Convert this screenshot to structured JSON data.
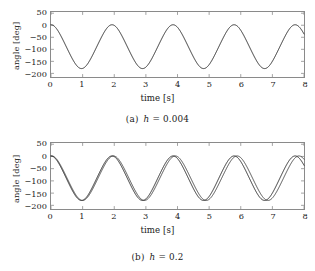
{
  "figure": {
    "background_color": "#ffffff",
    "frame_color": "#8a8a8a",
    "curve_color": "#2b2b2b"
  },
  "subfigures": [
    {
      "tag": "(a)",
      "caption_symbol": "h",
      "caption_equals": "=",
      "caption_value": "0.004",
      "caption_full": "(a)  h = 0.004"
    },
    {
      "tag": "(b)",
      "caption_symbol": "h",
      "caption_equals": "=",
      "caption_value": "0.2",
      "caption_full": "(b)  h = 0.2"
    }
  ],
  "chart_data": [
    {
      "type": "line",
      "title": "",
      "subcaption": "(a)  h = 0.004",
      "xlabel": "time [s]",
      "ylabel": "angle [deg]",
      "xlim": [
        0,
        8
      ],
      "ylim": [
        -215,
        55
      ],
      "xticks": [
        0,
        1,
        2,
        3,
        4,
        5,
        6,
        7,
        8
      ],
      "xticklabels": [
        "0",
        "1",
        "2",
        "3",
        "4",
        "5",
        "6",
        "7",
        "8"
      ],
      "yticks": [
        50,
        0,
        -50,
        -100,
        -150,
        -200
      ],
      "yticklabels": [
        "50",
        "0",
        "−50",
        "−100",
        "−150",
        "−200"
      ],
      "grid": false,
      "legend": false,
      "series": [
        {
          "name": "angle",
          "step_size": 0.004,
          "waveform": "pendulum-like oscillation",
          "offset_deg": -89,
          "amplitude_deg": 91,
          "period_s": 1.93,
          "phase_s": 0.0,
          "start_value_deg": 0,
          "peak_value_deg": 0,
          "trough_value_deg": -180,
          "cycles_visible": 4.15,
          "peaks_t": [
            0.0,
            1.93,
            3.86,
            5.79,
            7.72
          ],
          "troughs_t": [
            0.965,
            2.895,
            4.825,
            6.755
          ]
        }
      ]
    },
    {
      "type": "line",
      "title": "",
      "subcaption": "(b)  h = 0.2",
      "xlabel": "time [s]",
      "ylabel": "angle [deg]",
      "xlim": [
        0,
        8
      ],
      "ylim": [
        -215,
        55
      ],
      "xticks": [
        0,
        1,
        2,
        3,
        4,
        5,
        6,
        7,
        8
      ],
      "xticklabels": [
        "0",
        "1",
        "2",
        "3",
        "4",
        "5",
        "6",
        "7",
        "8"
      ],
      "yticks": [
        50,
        0,
        -50,
        -100,
        -150,
        -200
      ],
      "yticklabels": [
        "50",
        "0",
        "−50",
        "−100",
        "−150",
        "−200"
      ],
      "grid": false,
      "legend": false,
      "series": [
        {
          "name": "angle-reference",
          "step_size": 0.004,
          "waveform": "pendulum-like oscillation",
          "offset_deg": -89,
          "amplitude_deg": 91,
          "period_s": 1.93,
          "phase_s": 0.0,
          "start_value_deg": 0,
          "peak_value_deg": 0,
          "trough_value_deg": -180,
          "cycles_visible": 4.15,
          "peaks_t": [
            0.0,
            1.93,
            3.86,
            5.79,
            7.72
          ],
          "troughs_t": [
            0.965,
            2.895,
            4.825,
            6.755
          ]
        },
        {
          "name": "angle-coarse-step",
          "step_size": 0.2,
          "waveform": "pendulum-like oscillation with slight phase drift",
          "offset_deg": -89,
          "amplitude_deg": 91,
          "period_s": 1.955,
          "phase_s": 0.02,
          "start_value_deg": 0,
          "peak_value_deg": 0,
          "trough_value_deg": -180,
          "cycles_visible": 4.1,
          "peaks_t": [
            0.0,
            1.955,
            3.91,
            5.865,
            7.82
          ],
          "troughs_t": [
            0.98,
            2.93,
            4.89,
            6.84
          ]
        }
      ]
    }
  ]
}
